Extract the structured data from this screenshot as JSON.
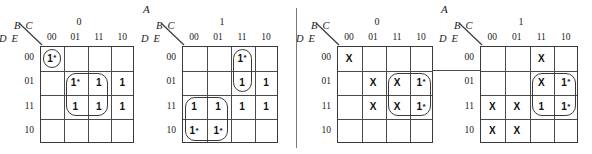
{
  "figure": {
    "type": "karnaugh-map-set",
    "variable_top": "A",
    "column_variables": "B C",
    "row_variables": "D E",
    "column_ticks": [
      "00",
      "01",
      "11",
      "10"
    ],
    "row_ticks": [
      "00",
      "01",
      "11",
      "10"
    ],
    "divider": true,
    "connector_between_maps_3_and_4": true
  },
  "maps": [
    {
      "id": "map-1",
      "a_value": "0",
      "a_label_shown": false,
      "cells": [
        [
          "1*",
          "",
          "",
          ""
        ],
        [
          "",
          "1*",
          "1",
          "1"
        ],
        [
          "",
          "1",
          "1",
          "1"
        ],
        [
          "",
          "",
          "",
          ""
        ]
      ],
      "groups": [
        {
          "name": "group-single-00-00",
          "row": 0,
          "col": 0,
          "rows": 1,
          "cols": 1
        },
        {
          "name": "group-quad-center",
          "row": 1,
          "col": 1,
          "rows": 2,
          "cols": 2
        }
      ]
    },
    {
      "id": "map-2",
      "a_value": "1",
      "a_label_shown": true,
      "cells": [
        [
          "",
          "",
          "1*",
          ""
        ],
        [
          "",
          "",
          "1",
          "1"
        ],
        [
          "1",
          "1",
          "1",
          "1"
        ],
        [
          "1*",
          "1*",
          "",
          ""
        ]
      ],
      "groups": [
        {
          "name": "group-vertical-col11",
          "row": 0,
          "col": 2,
          "rows": 2,
          "cols": 1
        },
        {
          "name": "group-quad-lower-left",
          "row": 2,
          "col": 0,
          "rows": 2,
          "cols": 2
        }
      ]
    },
    {
      "id": "map-3",
      "a_value": "0",
      "a_label_shown": false,
      "cells": [
        [
          "X",
          "",
          "",
          ""
        ],
        [
          "",
          "X",
          "X",
          "1*"
        ],
        [
          "",
          "X",
          "X",
          "1*"
        ],
        [
          "",
          "",
          "",
          ""
        ]
      ],
      "groups": [
        {
          "name": "group-quad-right",
          "row": 1,
          "col": 2,
          "rows": 2,
          "cols": 2
        }
      ]
    },
    {
      "id": "map-4",
      "a_value": "1",
      "a_label_shown": true,
      "cells": [
        [
          "",
          "",
          "X",
          ""
        ],
        [
          "",
          "",
          "X",
          "1*"
        ],
        [
          "X",
          "X",
          "1",
          "1*"
        ],
        [
          "X",
          "X",
          "",
          ""
        ]
      ],
      "groups": [
        {
          "name": "group-quad-right",
          "row": 1,
          "col": 2,
          "rows": 2,
          "cols": 2
        }
      ]
    }
  ],
  "colors": {
    "ink": "#1a1a1a",
    "rule": "#4a4a4a",
    "background": "#ffffff"
  }
}
